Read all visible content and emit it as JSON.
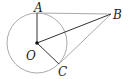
{
  "diagram": {
    "type": "geometry",
    "circle": {
      "center": "O",
      "cx": 37,
      "cy": 43,
      "r": 30,
      "stroke": "#aaaaaa"
    },
    "points": {
      "A": {
        "label": "A",
        "x": 37,
        "y": 13
      },
      "B": {
        "label": "B",
        "x": 111,
        "y": 14
      },
      "C": {
        "label": "C",
        "x": 59,
        "y": 64
      },
      "O": {
        "label": "O",
        "x": 37,
        "y": 43
      }
    },
    "segments": [
      {
        "from": "A",
        "to": "B",
        "color": "#aaaaaa"
      },
      {
        "from": "C",
        "to": "B",
        "color": "#aaaaaa"
      },
      {
        "from": "O",
        "to": "A",
        "color": "#333333"
      },
      {
        "from": "O",
        "to": "C",
        "color": "#333333"
      },
      {
        "from": "O",
        "to": "B",
        "color": "#333333"
      }
    ]
  }
}
